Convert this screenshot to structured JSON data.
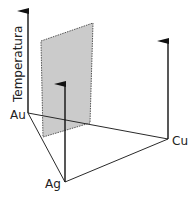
{
  "diagram": {
    "type": "ternary-phase-diagram-3d",
    "axis_label": "Temperatura",
    "vertices": {
      "au": {
        "label": "Au",
        "x": 28,
        "y": 113
      },
      "ag": {
        "label": "Ag",
        "x": 65,
        "y": 182
      },
      "cu": {
        "label": "Cu",
        "x": 168,
        "y": 139
      }
    },
    "axes": [
      {
        "name": "temperature-axis-au",
        "from": [
          28,
          113
        ],
        "to": [
          28,
          10
        ]
      },
      {
        "name": "temperature-axis-ag",
        "from": [
          65,
          182
        ],
        "to": [
          65,
          83
        ]
      },
      {
        "name": "temperature-axis-cu",
        "from": [
          168,
          139
        ],
        "to": [
          168,
          40
        ]
      }
    ],
    "base_edges": [
      {
        "name": "edge-au-ag",
        "from": [
          28,
          113
        ],
        "to": [
          65,
          182
        ]
      },
      {
        "name": "edge-ag-cu",
        "from": [
          65,
          182
        ],
        "to": [
          168,
          139
        ]
      },
      {
        "name": "edge-au-cu",
        "from": [
          28,
          113
        ],
        "to": [
          168,
          139
        ]
      }
    ],
    "section_plane": {
      "points": [
        [
          41,
          41
        ],
        [
          93,
          23
        ],
        [
          90,
          123
        ],
        [
          43,
          137
        ]
      ],
      "fill": "#cbcbcb",
      "stroke": "#555555"
    },
    "colors": {
      "line": "#2a2a2a",
      "text": "#222222"
    }
  }
}
